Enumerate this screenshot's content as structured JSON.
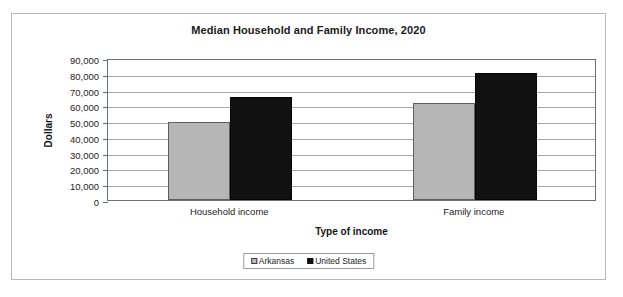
{
  "chart_data": {
    "type": "bar",
    "title": "Median Household and Family Income, 2020",
    "xlabel": "Type of income",
    "ylabel": "Dollars",
    "categories": [
      "Household income",
      "Family income"
    ],
    "series": [
      {
        "name": "Arkansas",
        "color": "#b6b6b6",
        "values": [
          49500,
          61500
        ]
      },
      {
        "name": "United States",
        "color": "#111111",
        "values": [
          65000,
          80500
        ]
      }
    ],
    "ylim": [
      0,
      90000
    ],
    "ytick_labels": [
      "90,000",
      "80,000",
      "70,000",
      "60,000",
      "50,000",
      "40,000",
      "30,000",
      "20,000",
      "10,000",
      "0"
    ],
    "ytick_values": [
      90000,
      80000,
      70000,
      60000,
      50000,
      40000,
      30000,
      20000,
      10000,
      0
    ],
    "grid": true,
    "legend_position": "bottom"
  },
  "legend": {
    "entries": [
      {
        "label": "Arkansas"
      },
      {
        "label": "United States"
      }
    ]
  }
}
